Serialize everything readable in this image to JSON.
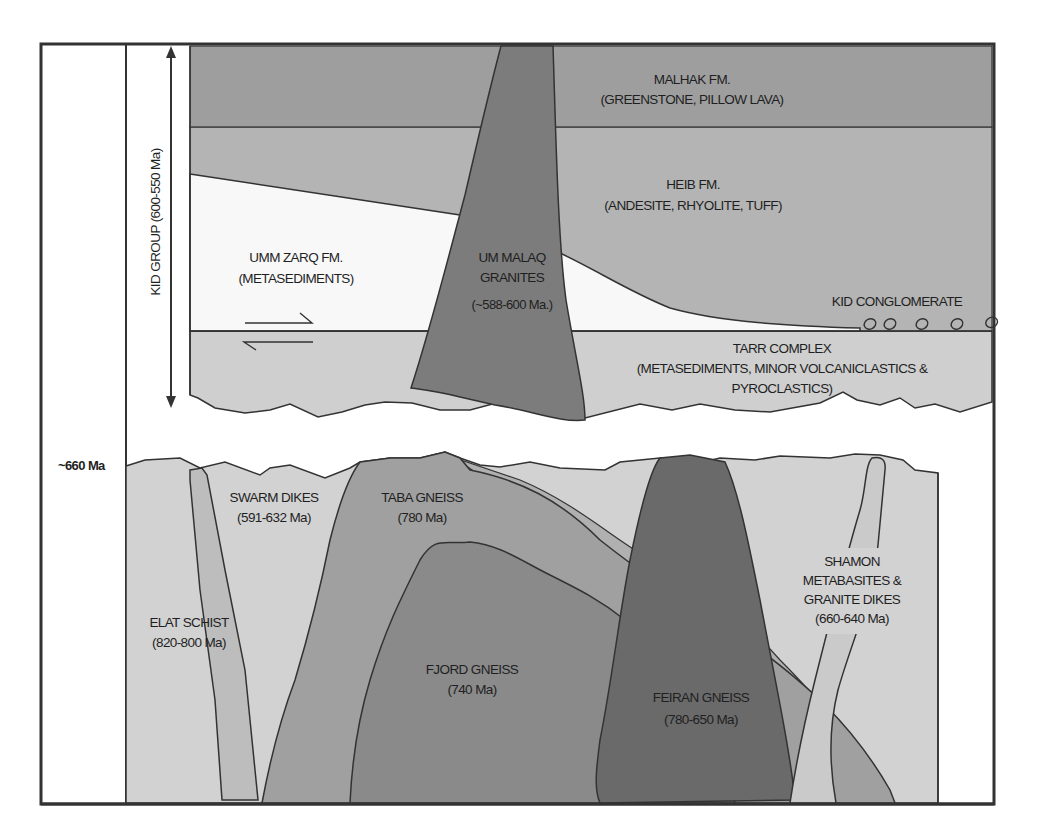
{
  "diagram": {
    "type": "geologic-cross-section",
    "colors": {
      "background": "#ffffff",
      "outline": "#333333",
      "malhak": "#9e9e9e",
      "heib": "#b4b4b4",
      "umm_zarq": "#f8f8f8",
      "tarr": "#cfcfcf",
      "granite_um_malaq": "#7c7c7c",
      "basement_light": "#d2d2d2",
      "elat_dike": "#bdbdbd",
      "taba_gneiss": "#a0a0a0",
      "fjord_gneiss": "#8a8a8a",
      "feiran_gneiss": "#6a6a6a",
      "shamon_dike": "#cacaca",
      "mid_band": "#b0b0b0"
    },
    "time_axis": {
      "group_label": "KID GROUP (600-550 Ma)",
      "marker_label": "~660 Ma"
    },
    "units": {
      "malhak": {
        "name": "MALHAK FM.",
        "desc": "(GREENSTONE, PILLOW LAVA)"
      },
      "heib": {
        "name": "HEIB FM.",
        "desc": "(ANDESITE, RHYOLITE, TUFF)"
      },
      "umm_zarq": {
        "name": "UMM  ZARQ FM.",
        "desc": "(METASEDIMENTS)"
      },
      "um_malaq": {
        "name1": "UM MALAQ",
        "name2": "GRANITES",
        "age": "(~588-600 Ma.)"
      },
      "kid_conglomerate": {
        "name": "KID CONGLOMERATE"
      },
      "tarr": {
        "name": "TARR COMPLEX",
        "desc1": "(METASEDIMENTS, MINOR VOLCANICLASTICS &",
        "desc2": "PYROCLASTICS)"
      },
      "swarm_dikes": {
        "name": "SWARM DIKES",
        "age": "(591-632 Ma)"
      },
      "taba_gneiss": {
        "name": "TABA GNEISS",
        "age": "(780 Ma)"
      },
      "elat_schist": {
        "name": "ELAT SCHIST",
        "age": "(820-800 Ma)"
      },
      "fjord_gneiss": {
        "name": "FJORD GNEISS",
        "age": "(740 Ma)"
      },
      "feiran_gneiss": {
        "name": "FEIRAN GNEISS",
        "age": "(780-650 Ma)"
      },
      "shamon": {
        "line1": "SHAMON",
        "line2": "METABASITES &",
        "line3": "GRANITE DIKES",
        "age": "(660-640 Ma)"
      }
    }
  }
}
